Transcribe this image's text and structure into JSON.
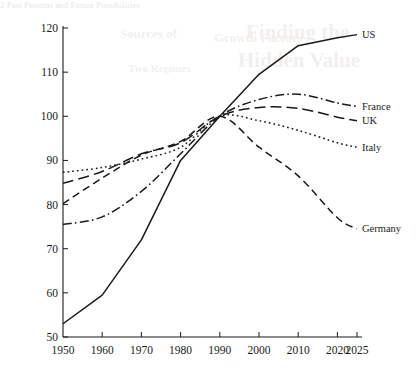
{
  "page": {
    "bleed_header": "2  Past Patterns and Future Possibilities",
    "bleed_lines": [
      "Finding the",
      "Hidden Value",
      "Sources of",
      "Growth Factors",
      "Two Regimes"
    ]
  },
  "chart_data": {
    "type": "line",
    "title": "",
    "xlabel": "",
    "ylabel": "",
    "x": [
      1950,
      1960,
      1970,
      1980,
      1990,
      2000,
      2010,
      2020,
      2025
    ],
    "xtick_labels": [
      "1950",
      "1960",
      "1970",
      "1980",
      "1990",
      "2000",
      "2010",
      "2020",
      "2025"
    ],
    "ytick_labels": [
      "50",
      "60",
      "70",
      "80",
      "90",
      "100",
      "110",
      "120"
    ],
    "yticks": [
      50,
      60,
      70,
      80,
      90,
      100,
      110,
      120
    ],
    "xlim": [
      1950,
      2025
    ],
    "ylim": [
      50,
      120
    ],
    "grid": false,
    "legend": "right-inline-labels",
    "series": [
      {
        "name": "US",
        "label": "US",
        "style": "solid",
        "values": [
          53.0,
          59.5,
          72.0,
          90.0,
          100.0,
          109.5,
          116.0,
          117.8,
          118.5
        ]
      },
      {
        "name": "France",
        "label": "France",
        "style": "dash-dot",
        "values": [
          75.5,
          77.2,
          83.0,
          91.5,
          100.0,
          103.8,
          105.0,
          103.0,
          102.2
        ]
      },
      {
        "name": "UK",
        "label": "UK",
        "style": "long-dash",
        "values": [
          84.8,
          87.5,
          91.5,
          94.0,
          100.0,
          102.0,
          101.8,
          99.8,
          99.0
        ]
      },
      {
        "name": "Italy",
        "label": "Italy",
        "style": "dotted",
        "values": [
          87.3,
          88.4,
          90.3,
          93.0,
          100.0,
          99.0,
          96.8,
          94.0,
          93.0
        ]
      },
      {
        "name": "Germany",
        "label": "Germany",
        "style": "dashed",
        "values": [
          80.2,
          86.0,
          91.2,
          94.3,
          100.0,
          93.0,
          86.5,
          77.0,
          74.5
        ]
      }
    ]
  }
}
